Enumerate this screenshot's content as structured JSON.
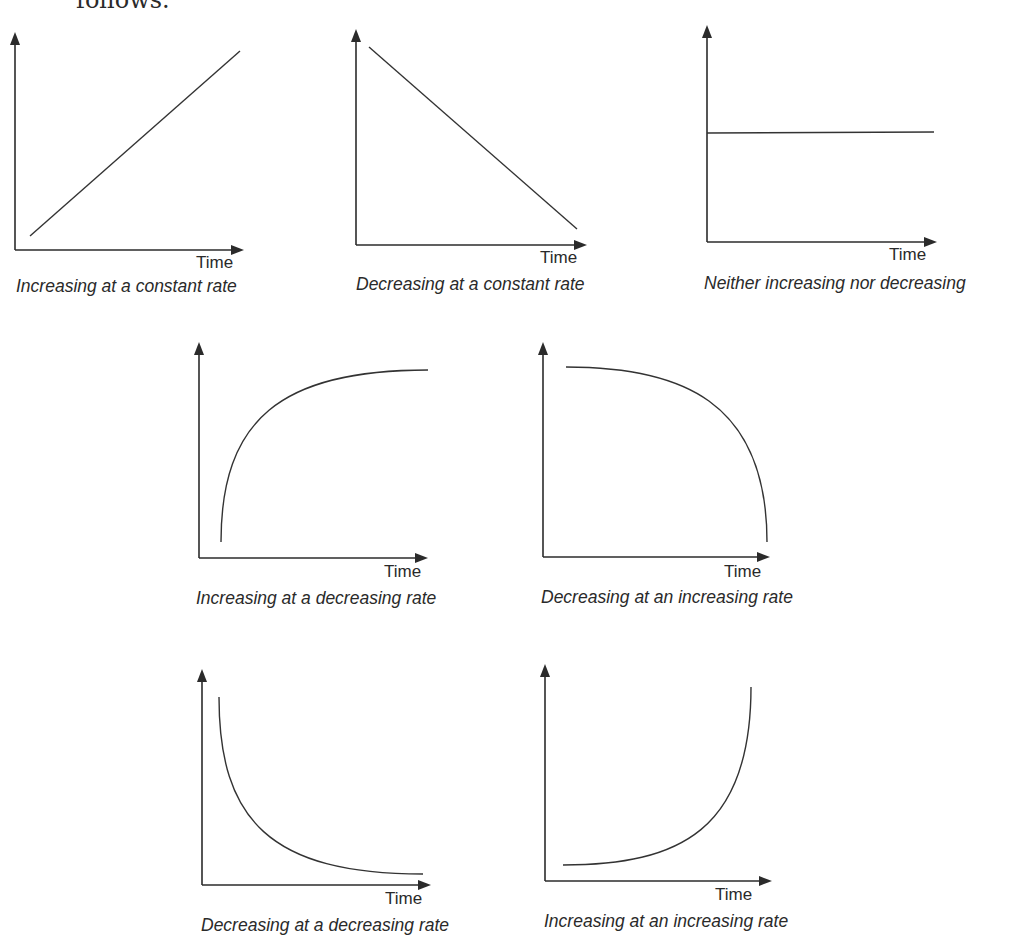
{
  "page": {
    "intro_text": "follows."
  },
  "axis_label": "Time",
  "panels": [
    {
      "id": "increasing-constant",
      "caption": "Increasing at a constant rate",
      "trend": "increasing",
      "rate": "constant"
    },
    {
      "id": "decreasing-constant",
      "caption": "Decreasing at a constant rate",
      "trend": "decreasing",
      "rate": "constant"
    },
    {
      "id": "flat",
      "caption": "Neither increasing nor decreasing",
      "trend": "flat",
      "rate": "zero"
    },
    {
      "id": "increasing-decreasing-rate",
      "caption": "Increasing at a decreasing rate",
      "trend": "increasing",
      "rate": "decreasing"
    },
    {
      "id": "decreasing-increasing-rate",
      "caption": "Decreasing at an increasing rate",
      "trend": "decreasing",
      "rate": "increasing"
    },
    {
      "id": "decreasing-decreasing-rate",
      "caption": "Decreasing at a decreasing rate",
      "trend": "decreasing",
      "rate": "decreasing"
    },
    {
      "id": "increasing-increasing-rate",
      "caption": "Increasing at an increasing  rate",
      "trend": "increasing",
      "rate": "increasing"
    }
  ]
}
